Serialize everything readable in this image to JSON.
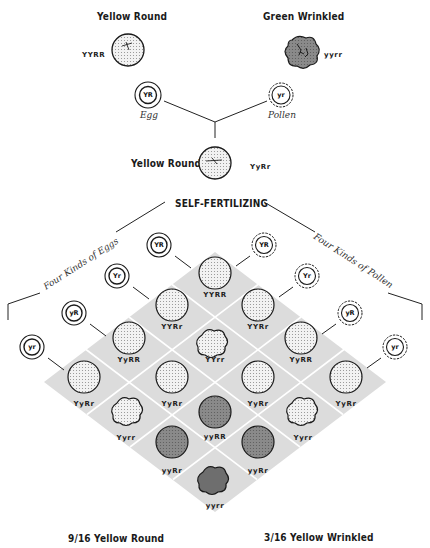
{
  "parents": {
    "left": {
      "title": "Yellow Round",
      "genotype": "YYRR",
      "seed": "yellow-round"
    },
    "right": {
      "title": "Green Wrinkled",
      "genotype": "yyrr",
      "seed": "green-wrinkled"
    }
  },
  "cross": {
    "egg": {
      "label": "Egg",
      "gamete": "YR"
    },
    "pollen": {
      "label": "Pollen",
      "gamete": "yr"
    }
  },
  "f1": {
    "title": "Yellow Round",
    "genotype": "YyRr"
  },
  "self_fertilizing": {
    "label": "SELF-FERTILIZING"
  },
  "egg_side": {
    "label": "Four Kinds of Eggs",
    "gametes": [
      "YR",
      "Yr",
      "yR",
      "yr"
    ]
  },
  "pollen_side": {
    "label": "Four Kinds of Pollen",
    "gametes": [
      "YR",
      "Yr",
      "yR",
      "yr"
    ]
  },
  "grid": {
    "cells": [
      {
        "row": 0,
        "col": 0,
        "genotype": "YYRR",
        "phenotype": "yellow-round"
      },
      {
        "row": 0,
        "col": 1,
        "genotype": "YYRr",
        "phenotype": "yellow-round"
      },
      {
        "row": 0,
        "col": 2,
        "genotype": "YyRR",
        "phenotype": "yellow-round"
      },
      {
        "row": 0,
        "col": 3,
        "genotype": "YyRr",
        "phenotype": "yellow-round"
      },
      {
        "row": 1,
        "col": 0,
        "genotype": "YYRr",
        "phenotype": "yellow-round"
      },
      {
        "row": 1,
        "col": 1,
        "genotype": "YYrr",
        "phenotype": "yellow-wrinkled"
      },
      {
        "row": 1,
        "col": 2,
        "genotype": "YyRr",
        "phenotype": "yellow-round"
      },
      {
        "row": 1,
        "col": 3,
        "genotype": "Yyrr",
        "phenotype": "yellow-wrinkled"
      },
      {
        "row": 2,
        "col": 0,
        "genotype": "YyRR",
        "phenotype": "yellow-round"
      },
      {
        "row": 2,
        "col": 1,
        "genotype": "YyRr",
        "phenotype": "yellow-round"
      },
      {
        "row": 2,
        "col": 2,
        "genotype": "yyRR",
        "phenotype": "green-round"
      },
      {
        "row": 2,
        "col": 3,
        "genotype": "yyRr",
        "phenotype": "green-round"
      },
      {
        "row": 3,
        "col": 0,
        "genotype": "YyRr",
        "phenotype": "yellow-round"
      },
      {
        "row": 3,
        "col": 1,
        "genotype": "Yyrr",
        "phenotype": "yellow-wrinkled"
      },
      {
        "row": 3,
        "col": 2,
        "genotype": "yyRr",
        "phenotype": "green-round"
      },
      {
        "row": 3,
        "col": 3,
        "genotype": "yyrr",
        "phenotype": "green-wrinkled"
      }
    ]
  },
  "ratios": {
    "left": {
      "fraction": "9/16",
      "label": "Yellow Round"
    },
    "right": {
      "fraction": "3/16",
      "label": "Yellow Wrinkled"
    }
  },
  "colors": {
    "grid_bg": "#dcdcdc",
    "grid_lines": "#ffffff",
    "yellow_seed": "#f1f1f1",
    "green_seed": "#8a8a8a",
    "green_wrinkled": "#6e6e6e",
    "ink": "#1a1a1a"
  }
}
